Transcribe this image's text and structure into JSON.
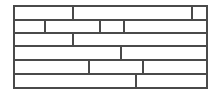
{
  "figure": {
    "type": "brick-bond-diagram",
    "canvas_width": 220,
    "canvas_height": 93,
    "background_color": "#ffffff",
    "line_color": "#4a4a4a",
    "fill_color": "#ffffff",
    "outer_border": {
      "x": 14,
      "y": 6,
      "width": 193,
      "height": 82,
      "stroke_width": 1.6
    },
    "joint_stroke_width": 1.2,
    "course_boundaries_y": [
      6,
      20,
      33,
      46,
      60,
      74,
      88
    ],
    "courses": [
      {
        "index": 1,
        "y_top": 6,
        "y_bottom": 20,
        "joints_x": [
          73,
          192
        ],
        "brick_count": 3
      },
      {
        "index": 2,
        "y_top": 20,
        "y_bottom": 33,
        "joints_x": [
          45,
          100,
          124
        ],
        "brick_count": 4
      },
      {
        "index": 3,
        "y_top": 33,
        "y_bottom": 46,
        "joints_x": [
          73
        ],
        "brick_count": 2
      },
      {
        "index": 4,
        "y_top": 46,
        "y_bottom": 60,
        "joints_x": [
          121
        ],
        "brick_count": 2
      },
      {
        "index": 5,
        "y_top": 60,
        "y_bottom": 74,
        "joints_x": [
          89,
          143
        ],
        "brick_count": 3
      },
      {
        "index": 6,
        "y_top": 74,
        "y_bottom": 88,
        "joints_x": [
          136
        ],
        "brick_count": 2
      }
    ]
  }
}
